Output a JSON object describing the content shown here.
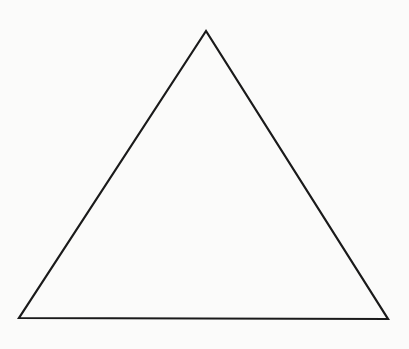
{
  "diagram": {
    "canvas": {
      "width": 409,
      "height": 349,
      "background": "#fbfbfa"
    },
    "shapes": [
      {
        "type": "triangle",
        "name": "triangle",
        "points": [
          [
            206,
            31
          ],
          [
            19,
            318
          ],
          [
            388,
            319
          ]
        ],
        "stroke": "#1a1a1a",
        "stroke_width": 2.2,
        "fill": "none"
      }
    ]
  }
}
